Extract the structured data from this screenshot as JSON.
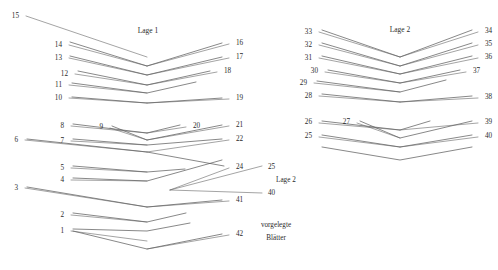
{
  "figure": {
    "title_left": "Lage 1",
    "title_right": "Lage 2",
    "annotations": {
      "lage2_inset": "Lage 2",
      "vorgelegte": "vorgelegte",
      "blatter": "Blätter"
    }
  },
  "left_group": {
    "name": "Lage 1",
    "title": "Lage 1",
    "title_pos": {
      "x": 148,
      "y": 33
    },
    "left_labels": [
      {
        "text": "15",
        "x": 19,
        "y": 18,
        "lx": 26,
        "ly": 16,
        "ex": 147,
        "ey": 57
      },
      {
        "text": "14",
        "x": 62,
        "y": 47,
        "lx": 69,
        "ly": 45,
        "ex": 147,
        "ey": 66
      },
      {
        "text": "13",
        "x": 62,
        "y": 60,
        "lx": 69,
        "ly": 58,
        "ex": 147,
        "ey": 75
      },
      {
        "text": "12",
        "x": 68,
        "y": 76,
        "lx": 75,
        "ly": 74,
        "ex": 147,
        "ey": 85
      },
      {
        "text": "11",
        "x": 62,
        "y": 87,
        "lx": 69,
        "ly": 85,
        "ex": 147,
        "ey": 93
      },
      {
        "text": "10",
        "x": 62,
        "y": 100,
        "lx": 69,
        "ly": 98,
        "ex": 147,
        "ey": 103
      },
      {
        "text": "8",
        "x": 64,
        "y": 128,
        "lx": 71,
        "ly": 126,
        "ex": 147,
        "ey": 133
      },
      {
        "text": "9",
        "x": 103,
        "y": 129,
        "lx": 110,
        "ly": 128,
        "ex": 147,
        "ey": 140
      },
      {
        "text": "6",
        "x": 18,
        "y": 142,
        "lx": 25,
        "ly": 140,
        "ex": 147,
        "ey": 152
      },
      {
        "text": "7",
        "x": 64,
        "y": 143,
        "lx": 71,
        "ly": 141,
        "ex": 147,
        "ey": 145
      },
      {
        "text": "5",
        "x": 64,
        "y": 170,
        "lx": 71,
        "ly": 168,
        "ex": 147,
        "ey": 172
      },
      {
        "text": "4",
        "x": 64,
        "y": 182,
        "lx": 71,
        "ly": 180,
        "ex": 147,
        "ey": 181
      },
      {
        "text": "3",
        "x": 18,
        "y": 190,
        "lx": 25,
        "ly": 188,
        "ex": 147,
        "ey": 207
      },
      {
        "text": "2",
        "x": 64,
        "y": 217,
        "lx": 71,
        "ly": 215,
        "ex": 147,
        "ey": 222
      },
      {
        "text": "1",
        "x": 64,
        "y": 233,
        "lx": 71,
        "ly": 231,
        "ex": 147,
        "ey": 241
      }
    ],
    "right_labels": [
      {
        "text": "16",
        "x": 236,
        "y": 45,
        "lx": 229,
        "ly": 44,
        "ex": 147,
        "ey": 66
      },
      {
        "text": "17",
        "x": 236,
        "y": 59,
        "lx": 229,
        "ly": 58,
        "ex": 147,
        "ey": 75
      },
      {
        "text": "18",
        "x": 224,
        "y": 73,
        "lx": 217,
        "ly": 72,
        "ex": 147,
        "ey": 85
      },
      {
        "text": "19",
        "x": 236,
        "y": 100,
        "lx": 229,
        "ly": 99,
        "ex": 147,
        "ey": 103
      },
      {
        "text": "20",
        "x": 193,
        "y": 128,
        "lx": 186,
        "ly": 127,
        "ex": 147,
        "ey": 133
      },
      {
        "text": "21",
        "x": 236,
        "y": 127,
        "lx": 229,
        "ly": 126,
        "ex": 147,
        "ey": 140
      },
      {
        "text": "22",
        "x": 236,
        "y": 141,
        "lx": 229,
        "ly": 140,
        "ex": 147,
        "ey": 152
      },
      {
        "text": "24",
        "x": 236,
        "y": 169,
        "lx": 229,
        "ly": 168,
        "ex": 170,
        "ey": 190
      },
      {
        "text": "41",
        "x": 236,
        "y": 202,
        "lx": 229,
        "ly": 201,
        "ex": 147,
        "ey": 207
      },
      {
        "text": "42",
        "x": 236,
        "y": 236,
        "lx": 229,
        "ly": 235,
        "ex": 147,
        "ey": 249
      }
    ],
    "layers": [
      {
        "x1": 70,
        "y1": 42,
        "x2": 147,
        "y2": 66,
        "x3": 222,
        "y3": 43
      },
      {
        "x1": 70,
        "y1": 56,
        "x2": 147,
        "y2": 75,
        "x3": 222,
        "y3": 57
      },
      {
        "x1": 78,
        "y1": 71,
        "x2": 147,
        "y2": 85,
        "x3": 210,
        "y3": 71
      },
      {
        "x1": 72,
        "y1": 83,
        "x2": 147,
        "y2": 93,
        "x3": 196,
        "y3": 82
      },
      {
        "x1": 72,
        "y1": 97,
        "x2": 147,
        "y2": 103,
        "x3": 222,
        "y3": 98
      },
      {
        "x1": 73,
        "y1": 124,
        "x2": 147,
        "y2": 133,
        "x3": 180,
        "y3": 125
      },
      {
        "x1": 112,
        "y1": 126,
        "x2": 147,
        "y2": 140,
        "x3": 222,
        "y3": 125
      },
      {
        "x1": 73,
        "y1": 139,
        "x2": 147,
        "y2": 145,
        "x3": 222,
        "y3": 139
      },
      {
        "x1": 27,
        "y1": 139,
        "x2": 147,
        "y2": 152,
        "x3": 224,
        "y3": 166
      },
      {
        "x1": 73,
        "y1": 166,
        "x2": 147,
        "y2": 172,
        "x3": 185,
        "y3": 169
      },
      {
        "x1": 73,
        "y1": 178,
        "x2": 147,
        "y2": 181,
        "x3": 222,
        "y3": 160
      },
      {
        "x1": 27,
        "y1": 187,
        "x2": 147,
        "y2": 207,
        "x3": 222,
        "y3": 200
      },
      {
        "x1": 73,
        "y1": 213,
        "x2": 147,
        "y2": 222,
        "x3": 186,
        "y3": 213
      },
      {
        "x1": 73,
        "y1": 229,
        "x2": 147,
        "y2": 231,
        "x3": 190,
        "y3": 223
      },
      {
        "x1": 73,
        "y1": 231,
        "x2": 147,
        "y2": 249,
        "x3": 222,
        "y3": 234
      }
    ]
  },
  "right_group": {
    "name": "Lage 2",
    "title": "Lage 2",
    "title_pos": {
      "x": 400,
      "y": 32
    },
    "left_labels": [
      {
        "text": "33",
        "x": 312,
        "y": 34,
        "lx": 319,
        "ly": 32,
        "ex": 400,
        "ey": 57
      },
      {
        "text": "32",
        "x": 312,
        "y": 47,
        "lx": 319,
        "ly": 45,
        "ex": 400,
        "ey": 66
      },
      {
        "text": "31",
        "x": 312,
        "y": 60,
        "lx": 319,
        "ly": 58,
        "ex": 400,
        "ey": 74
      },
      {
        "text": "30",
        "x": 318,
        "y": 73,
        "lx": 325,
        "ly": 72,
        "ex": 400,
        "ey": 83
      },
      {
        "text": "29",
        "x": 307,
        "y": 85,
        "lx": 314,
        "ly": 83,
        "ex": 400,
        "ey": 92
      },
      {
        "text": "28",
        "x": 312,
        "y": 98,
        "lx": 319,
        "ly": 96,
        "ex": 400,
        "ey": 102
      },
      {
        "text": "26",
        "x": 312,
        "y": 124,
        "lx": 319,
        "ly": 123,
        "ex": 400,
        "ey": 130
      },
      {
        "text": "27",
        "x": 350,
        "y": 124,
        "lx": 357,
        "ly": 123,
        "ex": 400,
        "ey": 138
      },
      {
        "text": "25",
        "x": 312,
        "y": 138,
        "lx": 319,
        "ly": 137,
        "ex": 400,
        "ey": 147
      }
    ],
    "right_labels": [
      {
        "text": "34",
        "x": 485,
        "y": 33,
        "lx": 478,
        "ly": 32,
        "ex": 400,
        "ey": 57
      },
      {
        "text": "35",
        "x": 485,
        "y": 46,
        "lx": 478,
        "ly": 45,
        "ex": 400,
        "ey": 66
      },
      {
        "text": "36",
        "x": 485,
        "y": 59,
        "lx": 478,
        "ly": 58,
        "ex": 400,
        "ey": 74
      },
      {
        "text": "37",
        "x": 473,
        "y": 73,
        "lx": 466,
        "ly": 72,
        "ex": 400,
        "ey": 83
      },
      {
        "text": "38",
        "x": 485,
        "y": 99,
        "lx": 478,
        "ly": 98,
        "ex": 400,
        "ey": 102
      },
      {
        "text": "39",
        "x": 485,
        "y": 124,
        "lx": 478,
        "ly": 123,
        "ex": 400,
        "ey": 130
      },
      {
        "text": "40",
        "x": 485,
        "y": 138,
        "lx": 478,
        "ly": 137,
        "ex": 400,
        "ey": 147
      }
    ],
    "layers": [
      {
        "x1": 322,
        "y1": 30,
        "x2": 400,
        "y2": 57,
        "x3": 472,
        "y3": 30
      },
      {
        "x1": 322,
        "y1": 43,
        "x2": 400,
        "y2": 66,
        "x3": 472,
        "y3": 43
      },
      {
        "x1": 322,
        "y1": 56,
        "x2": 400,
        "y2": 74,
        "x3": 472,
        "y3": 56
      },
      {
        "x1": 328,
        "y1": 70,
        "x2": 400,
        "y2": 83,
        "x3": 460,
        "y3": 70
      },
      {
        "x1": 317,
        "y1": 81,
        "x2": 400,
        "y2": 92,
        "x3": 446,
        "y3": 80
      },
      {
        "x1": 322,
        "y1": 94,
        "x2": 400,
        "y2": 102,
        "x3": 472,
        "y3": 96
      },
      {
        "x1": 322,
        "y1": 121,
        "x2": 400,
        "y2": 130,
        "x3": 430,
        "y3": 121
      },
      {
        "x1": 360,
        "y1": 121,
        "x2": 400,
        "y2": 138,
        "x3": 472,
        "y3": 121
      },
      {
        "x1": 322,
        "y1": 135,
        "x2": 400,
        "y2": 147,
        "x3": 472,
        "y3": 135
      },
      {
        "x1": 322,
        "y1": 147,
        "x2": 400,
        "y2": 160,
        "x3": 472,
        "y3": 147
      }
    ]
  },
  "inset_callouts": {
    "label_25": {
      "text": "25",
      "x": 268,
      "y": 169
    },
    "label_lage2": {
      "text": "Lage 2",
      "x": 276,
      "y": 182
    },
    "label_40": {
      "text": "40",
      "x": 268,
      "y": 195
    },
    "converge": {
      "x": 170,
      "y": 190
    },
    "lines": [
      {
        "x1": 170,
        "y1": 190,
        "x2": 262,
        "y2": 166
      },
      {
        "x1": 170,
        "y1": 190,
        "x2": 262,
        "y2": 193
      }
    ]
  },
  "bottom_note": {
    "line1": "vorgelegte",
    "line2": "Blätter",
    "x": 276,
    "y1": 227,
    "y2": 240
  }
}
